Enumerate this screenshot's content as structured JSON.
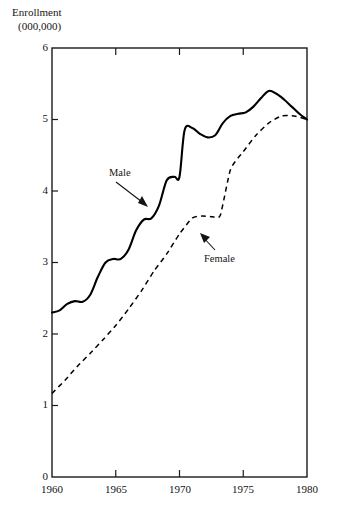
{
  "chart_data": {
    "type": "line",
    "title": "",
    "ylabel_lines": [
      "Enrollment",
      "(000,000)"
    ],
    "ylabel": "Enrollment (000,000)",
    "xlabel": "",
    "xlim": [
      1960,
      1980
    ],
    "ylim": [
      0,
      6
    ],
    "grid": false,
    "legend_position": "inline-annotations",
    "y_ticks": [
      0,
      1,
      2,
      3,
      4,
      5,
      6
    ],
    "y_tick_labels": [
      "0",
      "1",
      "2",
      "3",
      "4",
      "5",
      "6"
    ],
    "x_ticks": [
      1960,
      1965,
      1970,
      1975,
      1980
    ],
    "x_tick_labels": [
      "1960",
      "1965",
      "1970",
      "1975",
      "1980"
    ],
    "series": [
      {
        "name": "Male",
        "style": "solid",
        "color": "#000000",
        "x": [
          1960,
          1960.6,
          1961.2,
          1961.8,
          1962.4,
          1963.0,
          1963.6,
          1964.2,
          1964.8,
          1965.4,
          1966.0,
          1966.6,
          1967.2,
          1967.8,
          1968.4,
          1969.0,
          1969.6,
          1970.0,
          1970.4,
          1971.0,
          1971.6,
          1972.2,
          1972.8,
          1973.4,
          1974.0,
          1974.6,
          1975.2,
          1975.8,
          1976.4,
          1977.0,
          1977.6,
          1978.2,
          1978.8,
          1979.4,
          1980.0
        ],
        "y": [
          2.3,
          2.33,
          2.42,
          2.46,
          2.45,
          2.55,
          2.8,
          3.0,
          3.05,
          3.05,
          3.18,
          3.45,
          3.6,
          3.62,
          3.8,
          4.15,
          4.2,
          4.2,
          4.85,
          4.88,
          4.8,
          4.75,
          4.78,
          4.95,
          5.05,
          5.08,
          5.1,
          5.18,
          5.3,
          5.4,
          5.36,
          5.28,
          5.18,
          5.08,
          5.0
        ]
      },
      {
        "name": "Female",
        "style": "dashed",
        "color": "#000000",
        "x": [
          1960,
          1961,
          1962,
          1963,
          1964,
          1965,
          1966,
          1967,
          1968,
          1969,
          1970,
          1971,
          1971.8,
          1972.6,
          1973.2,
          1974.0,
          1975.0,
          1976.0,
          1977.0,
          1978.0,
          1979.0,
          1980.0
        ],
        "y": [
          1.17,
          1.35,
          1.55,
          1.73,
          1.92,
          2.12,
          2.35,
          2.6,
          2.88,
          3.12,
          3.4,
          3.62,
          3.65,
          3.64,
          3.66,
          4.3,
          4.55,
          4.78,
          4.95,
          5.05,
          5.05,
          5.0
        ]
      }
    ],
    "annotations": [
      {
        "label": "Male",
        "target_series": "Male",
        "arrow": "down-right"
      },
      {
        "label": "Female",
        "target_series": "Female",
        "arrow": "up-left"
      }
    ]
  },
  "axis": {
    "y_title_line1": "Enrollment",
    "y_title_line2": "(000,000)"
  },
  "labels": {
    "male": "Male",
    "female": "Female"
  },
  "ticks": {
    "y": [
      "6",
      "5",
      "4",
      "3",
      "2",
      "1",
      "0"
    ],
    "x": [
      "1960",
      "1965",
      "1970",
      "1975",
      "1980"
    ]
  },
  "colors": {
    "line": "#000000",
    "frame": "#1a1a1a",
    "text": "#141414",
    "background": "#ffffff"
  }
}
